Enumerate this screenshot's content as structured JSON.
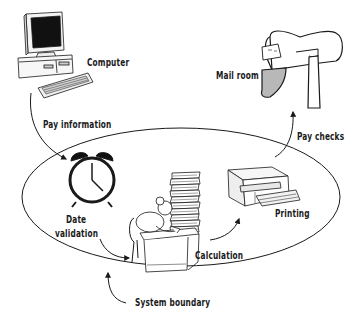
{
  "diagram": {
    "type": "system-boundary-flow",
    "nodes": [
      {
        "id": "computer",
        "label": "Computer",
        "icon": "computer-icon",
        "inside_boundary": false
      },
      {
        "id": "date_validation",
        "label_line1": "Date",
        "label_line2": "validation",
        "icon": "alarm-clock-icon",
        "inside_boundary": true
      },
      {
        "id": "calculation",
        "label": "Calculation",
        "icon": "worker-at-desk-icon",
        "inside_boundary": true
      },
      {
        "id": "printing",
        "label": "Printing",
        "icon": "printer-icon",
        "inside_boundary": true
      },
      {
        "id": "mail_room",
        "label": "Mail room",
        "icon": "mailbox-icon",
        "inside_boundary": false
      }
    ],
    "edges": [
      {
        "from": "computer",
        "to": "date_validation",
        "label": "Pay information"
      },
      {
        "from": "date_validation",
        "to": "calculation",
        "label": ""
      },
      {
        "from": "calculation",
        "to": "printing",
        "label": ""
      },
      {
        "from": "printing",
        "to": "mail_room",
        "label": "Pay checks"
      }
    ],
    "boundary": {
      "label": "System boundary",
      "shape": "ellipse"
    }
  },
  "labels": {
    "computer": "Computer",
    "pay_information": "Pay information",
    "mail_room": "Mail room",
    "pay_checks": "Pay checks",
    "date": "Date",
    "validation": "validation",
    "printing": "Printing",
    "calculation": "Calculation",
    "system_boundary": "System boundary"
  },
  "colors": {
    "ink": "#1a1a1a",
    "background": "#ffffff",
    "mailbox_flag_shade": "#b8b8b8"
  }
}
